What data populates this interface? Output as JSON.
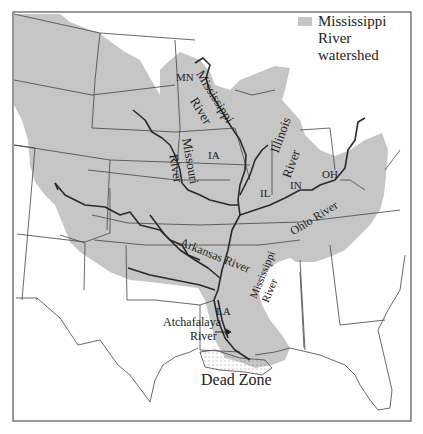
{
  "legend": {
    "swatch_color": "#c6c6c6",
    "line1": "Mississippi River",
    "line2": "watershed"
  },
  "states": {
    "mn": "MN",
    "ia": "IA",
    "il": "IL",
    "in": "IN",
    "oh": "OH",
    "la": "LA"
  },
  "rivers": {
    "mississippi_upper_1": "Mississippi",
    "mississippi_upper_2": "River",
    "missouri_1": "Missouri",
    "missouri_2": "River",
    "illinois_1": "Illinois",
    "illinois_2": "River",
    "ohio": "Ohio River",
    "arkansas": "Arkansas River",
    "mississippi_lower_1": "Mississippi",
    "mississippi_lower_2": "River",
    "atchafalaya_1": "Atchafalaya",
    "atchafalaya_2": "River"
  },
  "annotations": {
    "dead_zone": "Dead Zone"
  },
  "colors": {
    "watershed": "#c6c6c6",
    "river": "#2a2a2a",
    "border": "#444444",
    "background": "#ffffff"
  }
}
